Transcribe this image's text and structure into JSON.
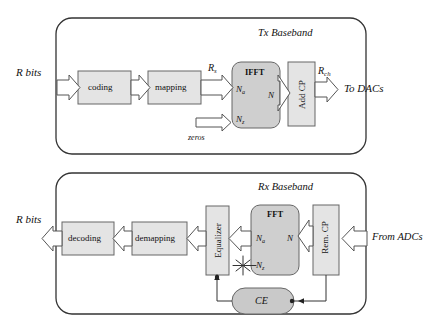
{
  "figure": {
    "type": "block-diagram",
    "title_tx": "Tx Baseband",
    "title_rx": "Rx Baseband"
  },
  "tx": {
    "panel_label": "Tx Baseband",
    "input_label": "R bits",
    "blocks": [
      {
        "id": "coding",
        "label": "coding"
      },
      {
        "id": "mapping",
        "label": "mapping"
      },
      {
        "id": "ifft",
        "label": "IFFT"
      },
      {
        "id": "addcp",
        "label": "Add CP"
      }
    ],
    "ifft_ports": {
      "in_active": "N",
      "in_active_sub": "a",
      "in_zeros": "N",
      "in_zeros_sub": "z",
      "out": "N"
    },
    "signal_labels": {
      "after_mapping": "R",
      "after_mapping_sub": "s",
      "after_cp": "R",
      "after_cp_sub": "ch",
      "zeros": "zeros"
    },
    "output_label": "To DACs"
  },
  "rx": {
    "panel_label": "Rx Baseband",
    "output_label": "R bits",
    "blocks": [
      {
        "id": "decoding",
        "label": "decoding"
      },
      {
        "id": "demapping",
        "label": "demapping"
      },
      {
        "id": "equalizer",
        "label": "Equalizer"
      },
      {
        "id": "fft",
        "label": "FFT"
      },
      {
        "id": "remcp",
        "label": "Rem. CP"
      },
      {
        "id": "ce",
        "label": "CE"
      }
    ],
    "fft_ports": {
      "out_active": "N",
      "out_active_sub": "a",
      "out_discard": "N",
      "out_discard_sub": "z",
      "in": "N"
    },
    "discard_marker": "discard-star",
    "input_label": "From ADCs"
  },
  "colors": {
    "block_fill": "#e4e4e4",
    "transform_fill": "#cfcfcf",
    "ce_fill": "#c9c9c9",
    "stroke": "#555555",
    "panel_stroke": "#333333",
    "arrow_fill": "#ffffff",
    "text": "#111111"
  }
}
